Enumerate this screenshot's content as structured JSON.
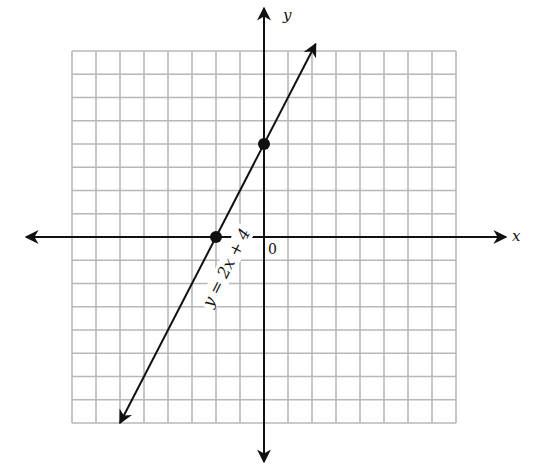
{
  "chart_data": {
    "type": "line",
    "title": "",
    "xlabel": "x",
    "ylabel": "y",
    "origin_label": "0",
    "grid": true,
    "xlim": [
      -8,
      8
    ],
    "ylim": [
      -8,
      8
    ],
    "series": [
      {
        "name": "y = 2x + 4",
        "equation": "y = 2x + 4",
        "slope": 2,
        "intercept": 4,
        "marked_points": [
          {
            "x": -2,
            "y": 0
          },
          {
            "x": 0,
            "y": 4
          }
        ]
      }
    ]
  },
  "labels": {
    "x_axis": "x",
    "y_axis": "y",
    "origin": "0",
    "equation": "y = 2x + 4"
  },
  "colors": {
    "grid": "#b8b8b8",
    "axis": "#111111",
    "line": "#111111"
  }
}
